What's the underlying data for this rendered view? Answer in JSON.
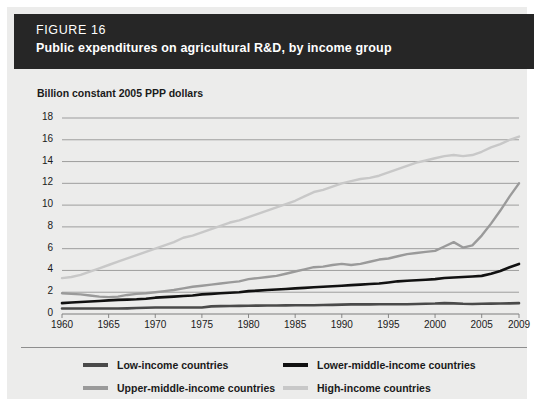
{
  "header": {
    "figure_label": "FIGURE 16",
    "title": "Public expenditures on agricultural R&D, by income group"
  },
  "axis_title": "Billion constant 2005 PPP dollars",
  "colors": {
    "header_bg": "#262626",
    "page_bg": "#ececeb",
    "low_income": "#4a4a4a",
    "lower_middle_income": "#111111",
    "upper_middle_income": "#9a9a9a",
    "high_income": "#c8c8c8",
    "gridline": "#7d7d7d"
  },
  "chart_data": {
    "type": "line",
    "title": "Public expenditures on agricultural R&D, by income group",
    "xlabel": "",
    "ylabel": "Billion constant 2005 PPP dollars",
    "xlim": [
      1960,
      2009
    ],
    "ylim": [
      0,
      18
    ],
    "yticks": [
      0,
      2,
      4,
      6,
      8,
      10,
      12,
      14,
      16,
      18
    ],
    "xticks": [
      1960,
      1965,
      1970,
      1975,
      1980,
      1985,
      1990,
      1995,
      2000,
      2005,
      2009
    ],
    "grid": true,
    "legend_position": "bottom",
    "x": [
      1960,
      1961,
      1962,
      1963,
      1964,
      1965,
      1966,
      1967,
      1968,
      1969,
      1970,
      1971,
      1972,
      1973,
      1974,
      1975,
      1976,
      1977,
      1978,
      1979,
      1980,
      1981,
      1982,
      1983,
      1984,
      1985,
      1986,
      1987,
      1988,
      1989,
      1990,
      1991,
      1992,
      1993,
      1994,
      1995,
      1996,
      1997,
      1998,
      1999,
      2000,
      2001,
      2002,
      2003,
      2004,
      2005,
      2006,
      2007,
      2008,
      2009
    ],
    "series": [
      {
        "name": "Low-income countries",
        "color": "#4a4a4a",
        "values": [
          0.5,
          0.5,
          0.5,
          0.5,
          0.5,
          0.5,
          0.5,
          0.52,
          0.55,
          0.57,
          0.6,
          0.6,
          0.6,
          0.6,
          0.6,
          0.6,
          0.7,
          0.72,
          0.74,
          0.75,
          0.76,
          0.77,
          0.78,
          0.78,
          0.79,
          0.8,
          0.8,
          0.8,
          0.82,
          0.84,
          0.86,
          0.88,
          0.88,
          0.88,
          0.89,
          0.9,
          0.9,
          0.9,
          0.92,
          0.94,
          0.96,
          1.0,
          0.98,
          0.94,
          0.92,
          0.94,
          0.95,
          0.96,
          0.98,
          1.0
        ]
      },
      {
        "name": "Lower-middle-income countries",
        "color": "#111111",
        "values": [
          1.0,
          1.05,
          1.1,
          1.15,
          1.2,
          1.25,
          1.3,
          1.32,
          1.35,
          1.4,
          1.5,
          1.55,
          1.6,
          1.65,
          1.7,
          1.8,
          1.85,
          1.9,
          1.95,
          2.0,
          2.1,
          2.15,
          2.2,
          2.25,
          2.3,
          2.35,
          2.4,
          2.45,
          2.5,
          2.55,
          2.6,
          2.65,
          2.7,
          2.75,
          2.8,
          2.9,
          3.0,
          3.05,
          3.1,
          3.15,
          3.2,
          3.3,
          3.35,
          3.4,
          3.45,
          3.5,
          3.7,
          3.95,
          4.3,
          4.6
        ]
      },
      {
        "name": "Upper-middle-income countries",
        "color": "#9a9a9a",
        "values": [
          1.9,
          1.85,
          1.8,
          1.7,
          1.6,
          1.55,
          1.6,
          1.75,
          1.85,
          1.9,
          2.0,
          2.1,
          2.2,
          2.35,
          2.5,
          2.6,
          2.7,
          2.8,
          2.9,
          3.0,
          3.2,
          3.3,
          3.4,
          3.5,
          3.7,
          3.9,
          4.1,
          4.3,
          4.35,
          4.5,
          4.6,
          4.5,
          4.6,
          4.8,
          5.0,
          5.1,
          5.3,
          5.5,
          5.6,
          5.7,
          5.8,
          6.2,
          6.6,
          6.1,
          6.3,
          7.2,
          8.3,
          9.5,
          10.8,
          12.0
        ]
      },
      {
        "name": "High-income countries",
        "color": "#c8c8c8",
        "values": [
          3.3,
          3.4,
          3.6,
          3.9,
          4.2,
          4.5,
          4.8,
          5.1,
          5.4,
          5.7,
          6.0,
          6.3,
          6.6,
          7.0,
          7.2,
          7.5,
          7.8,
          8.1,
          8.4,
          8.6,
          8.9,
          9.2,
          9.5,
          9.8,
          10.1,
          10.4,
          10.8,
          11.2,
          11.4,
          11.7,
          12.0,
          12.2,
          12.4,
          12.5,
          12.7,
          13.0,
          13.3,
          13.6,
          13.9,
          14.1,
          14.3,
          14.5,
          14.6,
          14.5,
          14.6,
          14.9,
          15.3,
          15.6,
          16.0,
          16.3
        ]
      }
    ]
  },
  "legend": [
    {
      "label": "Low-income countries",
      "color": "#4a4a4a"
    },
    {
      "label": "Lower-middle-income countries",
      "color": "#111111"
    },
    {
      "label": "Upper-middle-income countries",
      "color": "#9a9a9a"
    },
    {
      "label": "High-income countries",
      "color": "#c8c8c8"
    }
  ]
}
